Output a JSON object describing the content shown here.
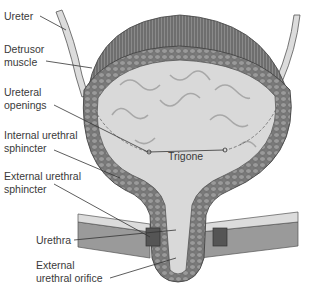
{
  "diagram": {
    "labels": [
      {
        "id": "ureter",
        "lines": [
          "Ureter"
        ]
      },
      {
        "id": "detrusor-muscle",
        "lines": [
          "Detrusor",
          "muscle"
        ]
      },
      {
        "id": "ureteral-openings",
        "lines": [
          "Ureteral",
          "openings"
        ]
      },
      {
        "id": "internal-urethral-sphincter",
        "lines": [
          "Internal urethral",
          "sphincter"
        ]
      },
      {
        "id": "external-urethral-sphincter",
        "lines": [
          "External urethral",
          "sphincter"
        ]
      },
      {
        "id": "urethra",
        "lines": [
          "Urethra"
        ]
      },
      {
        "id": "external-urethral-orifice",
        "lines": [
          "External",
          "urethral orifice"
        ]
      },
      {
        "id": "trigone",
        "lines": [
          "Trigone"
        ]
      }
    ],
    "colors": {
      "muscle_dark": "#6e6e6e",
      "wall_cells": "#8c8c8c",
      "lumen": "#d9d9d9",
      "ureter": "#dcdcdc",
      "leader_line": "#333333",
      "text": "#3a3a3a"
    }
  }
}
